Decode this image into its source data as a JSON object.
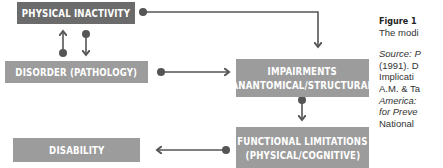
{
  "diagram": {
    "nodes": {
      "physical_inactivity": {
        "label": "PHYSICAL INACTIVITY",
        "color": "#6b6b6b"
      },
      "disorder": {
        "label": "DISORDER (PATHOLOGY)",
        "color": "#9c9c9c"
      },
      "impairments": {
        "line1": "IMPAIRMENTS",
        "line2": "(ANANTOMICAL/STRUCTURAL)",
        "color": "#9c9c9c"
      },
      "functional_limitations": {
        "line1": "FUNCTIONAL LIMITATIONS",
        "line2": "(PHYSICAL/COGNITIVE)",
        "color": "#9c9c9c"
      },
      "disability": {
        "label": "DISABILITY",
        "color": "#9c9c9c"
      }
    },
    "edges": [
      {
        "from": "physical_inactivity",
        "to": "impairments"
      },
      {
        "from": "physical_inactivity",
        "to": "disorder"
      },
      {
        "from": "disorder",
        "to": "physical_inactivity"
      },
      {
        "from": "disorder",
        "to": "impairments"
      },
      {
        "from": "impairments",
        "to": "functional_limitations"
      },
      {
        "from": "functional_limitations",
        "to": "disability"
      }
    ],
    "line_color": "#555555"
  },
  "caption": {
    "figure_label": "Figure 1",
    "line2": "The modi",
    "source_line1": "Source: P",
    "source_line2": "(1991). D",
    "source_line3": "Implicati",
    "source_line4": "A.M. & Ta",
    "source_line5": "America:",
    "source_line6": "for Preve",
    "source_line7": "National"
  }
}
